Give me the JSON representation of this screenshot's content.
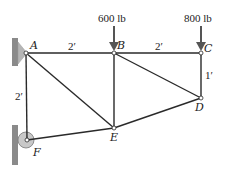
{
  "diagram": {
    "type": "truss",
    "nodes": [
      {
        "id": "A",
        "label": "A",
        "x": 26,
        "y": 53
      },
      {
        "id": "B",
        "label": "B",
        "x": 114,
        "y": 53
      },
      {
        "id": "C",
        "label": "C",
        "x": 201,
        "y": 53
      },
      {
        "id": "D",
        "label": "D",
        "x": 201,
        "y": 98
      },
      {
        "id": "E",
        "label": "E",
        "x": 114,
        "y": 128
      },
      {
        "id": "F",
        "label": "F",
        "x": 27,
        "y": 140
      }
    ],
    "members": [
      "AB",
      "BC",
      "CD",
      "AF",
      "AE",
      "BE",
      "BD",
      "DE",
      "EF"
    ],
    "loads": [
      {
        "node": "B",
        "label": "600 lb",
        "direction": "down"
      },
      {
        "node": "C",
        "label": "800 lb",
        "direction": "down"
      }
    ],
    "dimensions": [
      {
        "label": "2′",
        "between": "A-B"
      },
      {
        "label": "2′",
        "between": "B-C"
      },
      {
        "label": "1′",
        "between": "C-D"
      },
      {
        "label": "2′",
        "between": "A-F"
      }
    ],
    "supports": [
      {
        "node": "A",
        "type": "pin"
      },
      {
        "node": "F",
        "type": "roller"
      }
    ]
  },
  "colors": {
    "member": "#2a2a2a",
    "wall": "#8a8a8a",
    "wall_light": "#b8b8b8",
    "arrow": "#555555"
  }
}
